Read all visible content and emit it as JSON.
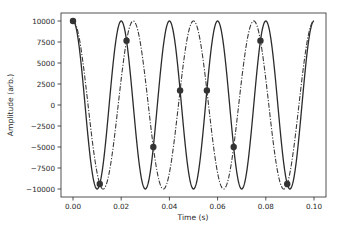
{
  "chart_data": {
    "type": "line",
    "title": "",
    "xlabel": "Time (s)",
    "ylabel": "Amplitude (arb.)",
    "xlim": [
      -0.005,
      0.105
    ],
    "ylim": [
      -11000,
      11000
    ],
    "grid": false,
    "legend": null,
    "x_ticks": [
      0.0,
      0.02,
      0.04,
      0.06,
      0.08,
      0.1
    ],
    "x_tick_labels": [
      "0.00",
      "0.02",
      "0.04",
      "0.06",
      "0.08",
      "0.10"
    ],
    "y_ticks": [
      10000,
      7500,
      5000,
      2500,
      0,
      -2500,
      -5000,
      -7500,
      -10000
    ],
    "y_tick_labels": [
      "10000",
      "7500",
      "5000",
      "2500",
      "0",
      "−2500",
      "−5000",
      "−7500",
      "−10000"
    ],
    "series": [
      {
        "name": "50 Hz cosine",
        "style": "solid",
        "color": "#2b2b2b",
        "function": "10000*cos(2*pi*50*t)",
        "frequency_hz": 50,
        "amplitude": 10000,
        "t_range": [
          0,
          0.1
        ]
      },
      {
        "name": "40 Hz cosine",
        "style": "dashdot",
        "color": "#3a3a3a",
        "function": "10000*cos(2*pi*40*t)",
        "frequency_hz": 40,
        "amplitude": 10000,
        "t_range": [
          0,
          0.1
        ]
      },
      {
        "name": "intersection samples",
        "style": "markers",
        "color": "#333333",
        "x": [
          0.0,
          0.01111,
          0.02222,
          0.03333,
          0.04444,
          0.05556,
          0.06667,
          0.07778,
          0.08889
        ],
        "y": [
          10000,
          -9397,
          7660,
          -5000,
          1736,
          1736,
          -5000,
          7660,
          -9397
        ]
      }
    ]
  }
}
